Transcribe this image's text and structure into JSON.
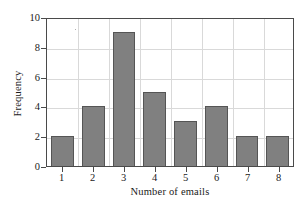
{
  "chart_data": {
    "type": "bar",
    "title": "",
    "subtitle": "",
    "xlabel": "Number of emails",
    "ylabel": "Frequency",
    "categories": [
      "1",
      "2",
      "3",
      "4",
      "5",
      "6",
      "7",
      "8"
    ],
    "values": [
      2,
      4,
      9,
      5,
      3,
      4,
      2,
      2
    ],
    "ylim": [
      0,
      10
    ],
    "yticks": [
      "0",
      "2",
      "4",
      "6",
      "8",
      "10"
    ],
    "ytick_values": [
      0,
      2,
      4,
      6,
      8,
      10
    ],
    "grid": "both",
    "legend": "none",
    "series": [
      {
        "name": "Frequency",
        "values": [
          2,
          4,
          9,
          5,
          3,
          4,
          2,
          2
        ]
      }
    ],
    "colors": {
      "bar_fill": "#808080",
      "bar_edge": "#555555",
      "grid": "#d9d9d9",
      "axis": "#4a4a4a",
      "text": "#1a1a1a",
      "background": "#ffffff"
    }
  }
}
